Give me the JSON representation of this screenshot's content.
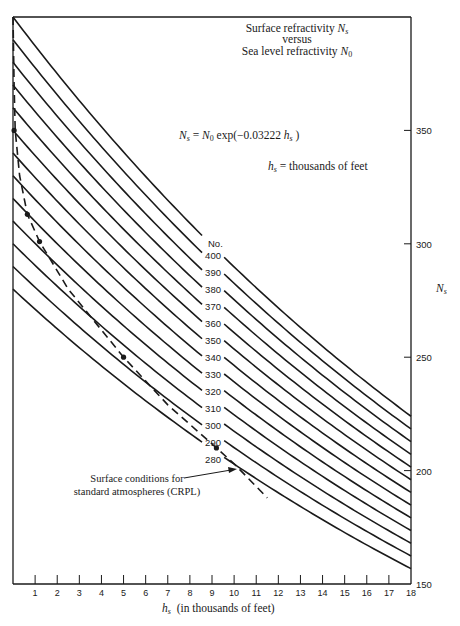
{
  "chart_data": {
    "type": "line",
    "title_lines": [
      "Surface refractivity N_s",
      "versus",
      "Sea level refractivity N_0"
    ],
    "title": {
      "line1_text": "Surface refractivity ",
      "line1_var": "N",
      "line1_sub": "s",
      "line2_text": "versus",
      "line3_text": "Sea level refractivity ",
      "line3_var": "N",
      "line3_sub": "0"
    },
    "formula": {
      "lhs_var": "N",
      "lhs_sub": "s",
      "eq": " = ",
      "rhs_var": "N",
      "rhs_sub": "0",
      "rhs_func": " exp(−0.03222 ",
      "rhs_h": "h",
      "rhs_h_sub": "s",
      "close": " )"
    },
    "unit_note": {
      "var": "h",
      "sub": "s",
      "text": " = thousands of feet"
    },
    "xlabel": {
      "var": "h",
      "sub": "s",
      "text": "  (in thousands of feet)"
    },
    "ylabel": {
      "var": "N",
      "sub": "s"
    },
    "x_range": [
      0,
      18
    ],
    "y_range": [
      150,
      400
    ],
    "x_ticks": [
      1,
      2,
      3,
      4,
      5,
      6,
      7,
      8,
      9,
      10,
      11,
      12,
      13,
      14,
      15,
      16,
      17,
      18
    ],
    "y_ticks": [
      350,
      300,
      250,
      200,
      150
    ],
    "decay_constant": 0.03222,
    "series_header": "No.",
    "series": [
      {
        "name": "400",
        "N0": 400
      },
      {
        "name": "390",
        "N0": 390
      },
      {
        "name": "380",
        "N0": 380
      },
      {
        "name": "370",
        "N0": 370
      },
      {
        "name": "360",
        "N0": 360
      },
      {
        "name": "350",
        "N0": 350
      },
      {
        "name": "340",
        "N0": 340
      },
      {
        "name": "330",
        "N0": 330
      },
      {
        "name": "320",
        "N0": 320
      },
      {
        "name": "310",
        "N0": 310
      },
      {
        "name": "300",
        "N0": 300
      },
      {
        "name": "290",
        "N0": 290
      },
      {
        "name": "280",
        "N0": 280
      }
    ],
    "standard_atmosphere_curve": {
      "name": "Surface conditions for standard atmospheres (CRPL)",
      "style": "dashed",
      "points": [
        {
          "h": 0.0,
          "N": 400
        },
        {
          "h": 0.05,
          "N": 370
        },
        {
          "h": 0.1,
          "N": 350
        },
        {
          "h": 0.3,
          "N": 330
        },
        {
          "h": 0.65,
          "N": 313
        },
        {
          "h": 1.2,
          "N": 301
        },
        {
          "h": 2.5,
          "N": 280
        },
        {
          "h": 5.0,
          "N": 250
        },
        {
          "h": 7.0,
          "N": 229
        },
        {
          "h": 9.2,
          "N": 210
        },
        {
          "h": 10.0,
          "N": 203
        },
        {
          "h": 11.5,
          "N": 188
        }
      ],
      "markers": [
        {
          "h": 0.05,
          "N": 350
        },
        {
          "h": 0.65,
          "N": 313
        },
        {
          "h": 1.2,
          "N": 301
        },
        {
          "h": 5.0,
          "N": 250
        },
        {
          "h": 9.2,
          "N": 210
        }
      ]
    },
    "annotation": {
      "line1": "Surface conditions for",
      "line2": "standard atmospheres (CRPL)"
    },
    "grid": false,
    "legend": "inline labels along curves near h=9"
  }
}
